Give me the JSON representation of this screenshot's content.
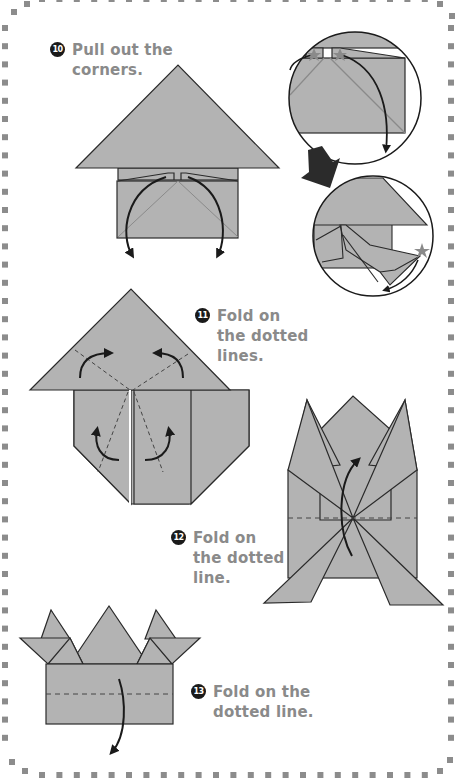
{
  "page": {
    "border_style": "dotted-square",
    "colors": {
      "paper": "#b3b3b3",
      "outline": "#2a2a2a",
      "arrow": "#1a1a1a",
      "text": "#8a8a8a",
      "border_dots": "#8c8c8c",
      "star": "#8a8a8a",
      "big_arrow": "#2b2b2b"
    }
  },
  "steps": [
    {
      "number": "10",
      "lines": [
        "Pull out the",
        "corners."
      ]
    },
    {
      "number": "11",
      "lines": [
        "Fold on",
        "the dotted",
        "lines."
      ]
    },
    {
      "number": "12",
      "lines": [
        "Fold on",
        "the dotted",
        "line."
      ]
    },
    {
      "number": "13",
      "lines": [
        "Fold on the",
        "dotted line."
      ]
    }
  ],
  "icons": {
    "detail_circles": [
      "zoom-detail-before",
      "zoom-detail-after"
    ],
    "star_markers": 3,
    "transition_arrow": "big-down-left-arrow"
  }
}
